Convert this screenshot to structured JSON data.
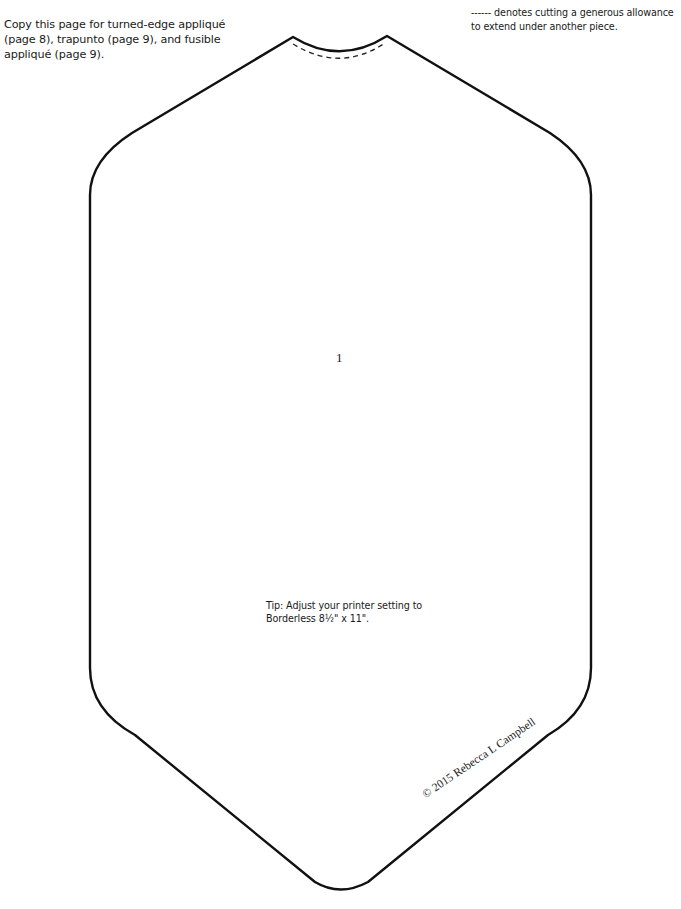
{
  "instructions": {
    "copy_note": "Copy this page for turned-edge appliqué (page 8), trapunto (page 9), and fusible appliqué (page 9).",
    "dashed_legend": "------ denotes cutting a generous allowance to extend under another piece."
  },
  "pattern": {
    "piece_number": "1",
    "shape": "elongated-hexagon-with-concave-top",
    "outline_color": "#111111",
    "dashed_allowance": "top concave edge"
  },
  "tip": {
    "text_line1": "Tip: Adjust your printer setting to",
    "text_line2": "Borderless 8½\" x 11\"."
  },
  "copyright": {
    "text": "© 2015 Rebecca L Campbell"
  }
}
